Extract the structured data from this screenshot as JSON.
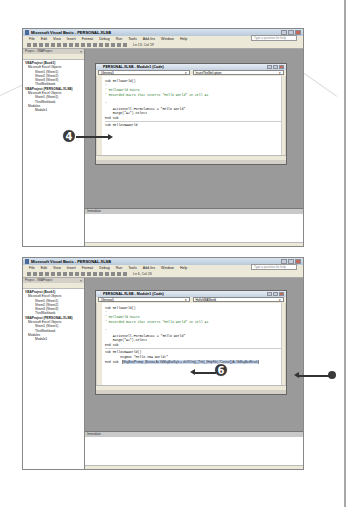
{
  "page": {
    "step_a": "4",
    "step_b": "6"
  },
  "screenshot1": {
    "title": "Microsoft Visual Basic - PERSONAL.XLSB",
    "menu": [
      "File",
      "Edit",
      "View",
      "Insert",
      "Format",
      "Debug",
      "Run",
      "Tools",
      "Add-Ins",
      "Window",
      "Help"
    ],
    "help_placeholder": "Type a question for help",
    "toolbar_pos": "Ln 13, Col 19",
    "project_pane_title": "Project - VBAProject",
    "tree": [
      "VBAProject (Book1)",
      "Microsoft Excel Objects",
      "Sheet1 (Sheet1)",
      "Sheet2 (Sheet2)",
      "Sheet3 (Sheet3)",
      "ThisWorkbook",
      "VBAProject (PERSONAL.XLSB)",
      "Microsoft Excel Objects",
      "Sheet1 (Sheet1)",
      "ThisWorkbook",
      "Modules",
      "Module1"
    ],
    "code_title": "PERSONAL.XLSB - Module1 (Code)",
    "dropdown_left": "(General)",
    "dropdown_right": "InsertTheNet'cption",
    "code_lines": [
      "Sub HelloWorld()",
      "'",
      "' HelloWorld Macro",
      "' Recorded macro that inserts \"Hello World\" in cell A1",
      "",
      "'",
      "    ActiveCell.FormulaR1C1 = \"Hello World\"",
      "    Range(\"A2\").Select",
      "End Sub"
    ],
    "new_line": "Sub HelloVBAWorld",
    "immediate_title": "Immediate"
  },
  "screenshot2": {
    "title": "Microsoft Visual Basic - PERSONAL.XLSB",
    "menu": [
      "File",
      "Edit",
      "View",
      "Insert",
      "Format",
      "Debug",
      "Run",
      "Tools",
      "Add-Ins",
      "Window",
      "Help"
    ],
    "help_placeholder": "Type a question for help",
    "toolbar_pos": "Ln 6, Col 26",
    "project_pane_title": "Project - VBAProject",
    "tree": [
      "VBAProject (Book1)",
      "Microsoft Excel Objects",
      "Sheet1 (Sheet1)",
      "Sheet2 (Sheet2)",
      "Sheet3 (Sheet3)",
      "ThisWorkbook",
      "VBAProject (PERSONAL.XLSB)",
      "Microsoft Excel Objects",
      "Sheet1 (Sheet1)",
      "ThisWorkbook",
      "Modules",
      "Module1"
    ],
    "code_title": "PERSONAL.XLSB - Module1 (Code)",
    "dropdown_left": "(General)",
    "dropdown_right": "HelloVBAWorld",
    "code_lines": [
      "Sub HelloWorld()",
      "'",
      "' HelloWorld Macro",
      "' Recorded macro that inserts \"Hello World\" in cell A1",
      "",
      "'",
      "    ActiveCell.FormulaR1C1 = \"Hello World\"",
      "    Range(\"A2\").Select",
      "End Sub"
    ],
    "new_lines": [
      "Sub HelloVBAWorld()",
      "        MsgBox \"Hello VBA World!\"",
      "End Sub"
    ],
    "tooltip": "MsgBox(Prompt, [Buttons As VbMsgBoxStyle = vbOKOnly], [Title], [HelpFile], [Context]) As VbMsgBoxResult",
    "immediate_title": "Immediate"
  }
}
